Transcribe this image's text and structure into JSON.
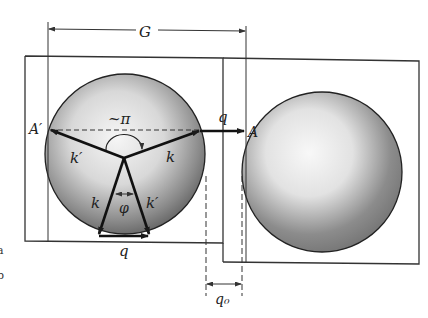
{
  "figure": {
    "type": "reciprocal-space scattering diagram (umklapp process)",
    "labels": {
      "G": "G",
      "A_prime": "A′",
      "A": "A",
      "pi_approx": "~π",
      "q_arrow": "q",
      "k_upper_right": "k",
      "k_prime_upper_left": "k′",
      "k_lower_left": "k",
      "k_prime_lower_right": "k′",
      "phi": "φ",
      "q_bottom": "q",
      "q0": "q₀"
    },
    "margin_marks": [
      "a",
      "b"
    ],
    "elements": {
      "left_zone": "Brillouin zone with shaded Fermi sphere, showing k → k′ scattering",
      "right_zone": "adjacent Brillouin zone with shaded Fermi sphere",
      "dimension_G": "reciprocal lattice vector spanning A′ to A",
      "dimension_q0": "minimum gap between spheres"
    },
    "colors": {
      "line": "#1a1a1a",
      "sphere_light": "#f4f4f4",
      "sphere_dark": "#6a6a6a",
      "frame": "#333333"
    }
  }
}
